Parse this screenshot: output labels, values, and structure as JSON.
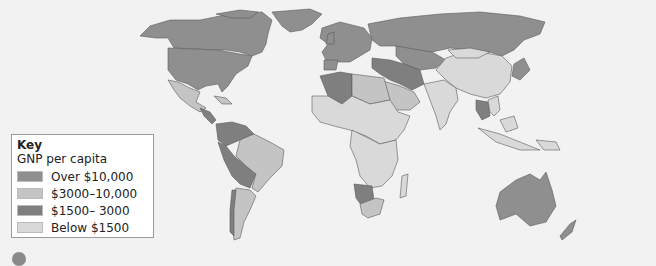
{
  "legend": {
    "title": "Key",
    "subtitle": "GNP per capita",
    "items": [
      {
        "label": "Over $10,000",
        "color": "#8f8f8f"
      },
      {
        "label": "$3000–10,000",
        "color": "#c4c4c4"
      },
      {
        "label": "$1500– 3000",
        "color": "#7f7f7f"
      },
      {
        "label": "Below $1500",
        "color": "#d9d9d9"
      }
    ]
  },
  "colors": {
    "background": "#f2f2f2",
    "over_10000": "#8f8f8f",
    "range_3000_10000": "#c4c4c4",
    "range_1500_3000": "#7f7f7f",
    "below_1500": "#d9d9d9",
    "border": "#555555"
  }
}
